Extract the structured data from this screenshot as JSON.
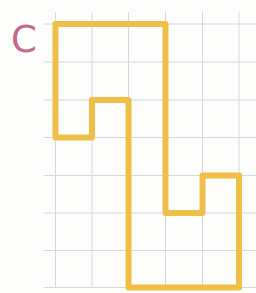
{
  "figure": {
    "label": "C",
    "label_color": "#c4698a",
    "background_color": "#fdfdfc",
    "grid": {
      "line_color": "#d5d8da",
      "line_width": 1,
      "vertical_lines_x": [
        55.5,
        92,
        128.5,
        165.5,
        202.5,
        239
      ],
      "vertical_lines_y_range": [
        12,
        287.5
      ],
      "horizontal_lines_y": [
        24,
        62,
        100,
        137.5,
        175.5,
        213,
        250.5,
        287.5
      ],
      "horizontal_lines_x_range": [
        44,
        256
      ],
      "cell_size_px": 37
    },
    "shape": {
      "stroke_color": "#f0bf48",
      "stroke_width": 6,
      "fill": "none",
      "vertices_px": [
        [
          55.5,
          24
        ],
        [
          165.5,
          24
        ],
        [
          165.5,
          213
        ],
        [
          202.5,
          213
        ],
        [
          202.5,
          175.5
        ],
        [
          239,
          175.5
        ],
        [
          239,
          287.5
        ],
        [
          128.5,
          287.5
        ],
        [
          128.5,
          100
        ],
        [
          92,
          100
        ],
        [
          92,
          137.5
        ],
        [
          55.5,
          137.5
        ]
      ],
      "vertices_grid_units": [
        [
          1,
          0
        ],
        [
          4,
          0
        ],
        [
          4,
          5
        ],
        [
          5,
          5
        ],
        [
          5,
          4
        ],
        [
          6,
          4
        ],
        [
          6,
          7
        ],
        [
          3,
          7
        ],
        [
          3,
          2
        ],
        [
          2,
          2
        ],
        [
          2,
          3
        ],
        [
          1,
          3
        ]
      ]
    },
    "canvas_size": {
      "width": 256,
      "height": 293
    }
  }
}
